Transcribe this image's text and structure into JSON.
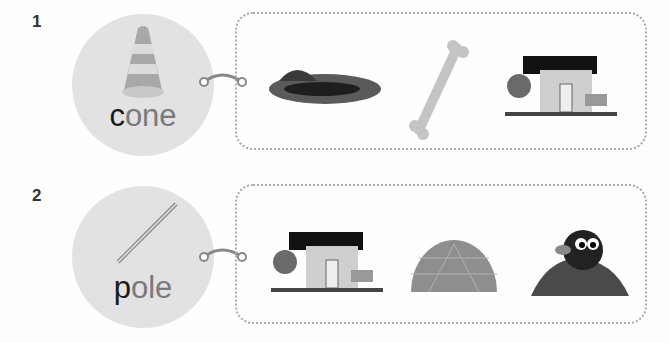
{
  "exercises": [
    {
      "number": "1",
      "word_first": "c",
      "word_rest": "one",
      "target_icon": "traffic-cone-icon",
      "options": [
        {
          "name": "hole",
          "icon": "hole-icon"
        },
        {
          "name": "bone",
          "icon": "bone-icon"
        },
        {
          "name": "house",
          "icon": "house-icon"
        }
      ]
    },
    {
      "number": "2",
      "word_first": "p",
      "word_rest": "ole",
      "target_icon": "pole-icon",
      "options": [
        {
          "name": "house",
          "icon": "house-icon"
        },
        {
          "name": "dome",
          "icon": "dome-icon"
        },
        {
          "name": "mole",
          "icon": "mole-icon"
        }
      ]
    }
  ],
  "colors": {
    "circle": "#e2e2e2",
    "text_first": "#1a1a1a",
    "text_rest": "#7a7a7a",
    "border": "#aaaaaa"
  }
}
